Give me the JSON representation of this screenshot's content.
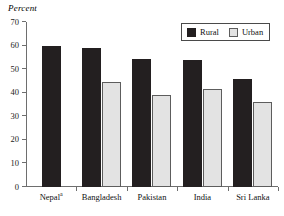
{
  "chart_data": {
    "type": "bar",
    "title": "",
    "subtitle": "",
    "xlabel": "",
    "ylabel": "Percent",
    "ylim": [
      0,
      70
    ],
    "yticks": [
      0,
      10,
      20,
      30,
      40,
      50,
      60,
      70
    ],
    "ytick_labels": [
      "0",
      "10",
      "20",
      "30",
      "40",
      "50",
      "60",
      "70"
    ],
    "grid": false,
    "legend_position": "top-right",
    "categories": [
      "Nepal",
      "Bangladesh",
      "Pakistan",
      "India",
      "Sri Lanka"
    ],
    "category_labels": [
      "Nepal",
      "Bangladesh",
      "Pakistan",
      "India",
      "Sri Lanka"
    ],
    "category_footnotes": [
      "a",
      "",
      "",
      "",
      ""
    ],
    "series": [
      {
        "name": "Rural",
        "color": "#231f20",
        "values": [
          60.0,
          59.0,
          54.5,
          54.0,
          46.0
        ]
      },
      {
        "name": "Urban",
        "color": "#e3e3e3",
        "values": [
          null,
          44.5,
          39.0,
          41.5,
          36.0
        ]
      }
    ]
  },
  "legend": {
    "items": [
      {
        "label": "Rural",
        "swatch": "rural"
      },
      {
        "label": "Urban",
        "swatch": "urban"
      }
    ]
  },
  "axis": {
    "y_title": "Percent"
  }
}
